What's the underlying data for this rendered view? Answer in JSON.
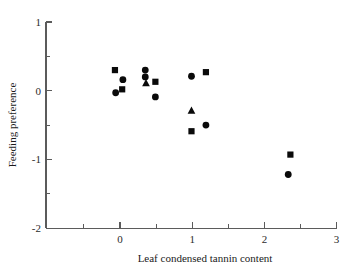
{
  "chart_data": {
    "type": "scatter",
    "title": "",
    "xlabel": "Leaf condensed tannin content",
    "ylabel": "Feeding preference",
    "xlim": [
      -0.55,
      3.0
    ],
    "ylim": [
      -2,
      1
    ],
    "grid": false,
    "legend": "none",
    "x_ticks_major": [
      0,
      1,
      2,
      3
    ],
    "x_tick_labels": [
      "0",
      "1",
      "2",
      "3"
    ],
    "x_ticks_minor": [
      -0.5,
      0.5,
      1.5,
      2.5
    ],
    "y_ticks_major": [
      1,
      0,
      -1,
      -2
    ],
    "y_tick_labels": [
      "1",
      "0",
      "-1",
      "-2"
    ],
    "y_ticks_minor": [
      0.5,
      -0.5,
      -1.5
    ],
    "marker_color": "#0a0a0a",
    "series": [
      {
        "name": "circle",
        "marker": "circle",
        "points": [
          {
            "x": 0.04,
            "y": 0.16
          },
          {
            "x": -0.06,
            "y": -0.03
          },
          {
            "x": 0.35,
            "y": 0.3
          },
          {
            "x": 0.35,
            "y": 0.2
          },
          {
            "x": 0.49,
            "y": -0.09
          },
          {
            "x": 0.99,
            "y": 0.21
          },
          {
            "x": 1.19,
            "y": -0.5
          },
          {
            "x": 2.33,
            "y": -1.22
          }
        ]
      },
      {
        "name": "square",
        "marker": "square",
        "points": [
          {
            "x": -0.07,
            "y": 0.3
          },
          {
            "x": 0.03,
            "y": 0.02
          },
          {
            "x": 0.49,
            "y": 0.13
          },
          {
            "x": 1.19,
            "y": 0.27
          },
          {
            "x": 0.99,
            "y": -0.59
          },
          {
            "x": 2.36,
            "y": -0.93
          }
        ]
      },
      {
        "name": "triangle",
        "marker": "triangle",
        "points": [
          {
            "x": 0.36,
            "y": 0.11
          },
          {
            "x": 0.99,
            "y": -0.29
          }
        ]
      }
    ]
  }
}
